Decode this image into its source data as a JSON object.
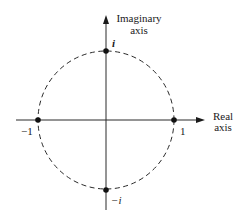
{
  "diagram": {
    "colors": {
      "ink": "#1a1a1a",
      "background": "#ffffff"
    },
    "axes": {
      "imaginary": {
        "label_line1": "Imaginary",
        "label_line2": "axis"
      },
      "real": {
        "label_line1": "Real",
        "label_line2": "axis"
      }
    },
    "circle": {
      "style": "dashed",
      "radius": 1,
      "center": [
        0,
        0
      ]
    },
    "points": [
      {
        "name": "i",
        "label": "i",
        "coords": [
          0,
          1
        ]
      },
      {
        "name": "-i",
        "label": "−i",
        "coords": [
          0,
          -1
        ]
      },
      {
        "name": "-1",
        "label": "−1",
        "coords": [
          -1,
          0
        ]
      },
      {
        "name": "1",
        "label": "1",
        "coords": [
          1,
          0
        ]
      }
    ]
  }
}
